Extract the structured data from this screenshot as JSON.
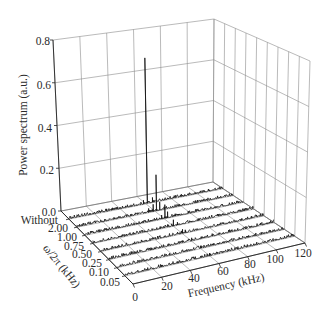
{
  "chart_data": {
    "type": "3d-waterfall",
    "title": "",
    "xlabel": "Frequency (kHz)",
    "ylabel": "ω/2π (kHz)",
    "zlabel": "Power spectrum (a.u.)",
    "x_range": [
      0,
      120
    ],
    "x_ticks": [
      "0",
      "20",
      "40",
      "60",
      "80",
      "100",
      "120"
    ],
    "y_categories": [
      "Without",
      "2.00",
      "1.00",
      "0.75",
      "0.50",
      "0.25",
      "0.10",
      "0.05"
    ],
    "z_range": [
      0,
      0.8
    ],
    "z_ticks": [
      "0.0",
      "0.2",
      "0.4",
      "0.6",
      "0.8"
    ],
    "grid": true,
    "legend": null,
    "noise_level": 0.014,
    "peak_frequency_khz": 60,
    "peak_power": [
      0.69,
      0.17,
      0.065,
      0.03,
      0.02,
      0.015,
      0.012,
      0.01
    ],
    "series": [
      {
        "name": "Without",
        "peaks": [
          {
            "x": 61,
            "y": 0.69
          },
          {
            "x": 58,
            "y": 0.02
          },
          {
            "x": 65,
            "y": 0.025
          }
        ]
      },
      {
        "name": "2.00",
        "peaks": [
          {
            "x": 61,
            "y": 0.17
          },
          {
            "x": 55,
            "y": 0.02
          },
          {
            "x": 58.5,
            "y": 0.035
          },
          {
            "x": 63.5,
            "y": 0.04
          }
        ]
      },
      {
        "name": "1.00",
        "peaks": [
          {
            "x": 60.5,
            "y": 0.065
          },
          {
            "x": 58,
            "y": 0.02
          },
          {
            "x": 62.5,
            "y": 0.03
          }
        ]
      },
      {
        "name": "0.75",
        "peaks": [
          {
            "x": 60,
            "y": 0.03
          },
          {
            "x": 63,
            "y": 0.015
          }
        ]
      },
      {
        "name": "0.50",
        "peaks": [
          {
            "x": 60,
            "y": 0.02
          },
          {
            "x": 62,
            "y": 0.015
          }
        ]
      },
      {
        "name": "0.25",
        "peaks": [
          {
            "x": 60,
            "y": 0.015
          }
        ]
      },
      {
        "name": "0.10",
        "peaks": [
          {
            "x": 60,
            "y": 0.012
          }
        ]
      },
      {
        "name": "0.05",
        "peaks": [
          {
            "x": 60,
            "y": 0.01
          }
        ]
      }
    ]
  }
}
